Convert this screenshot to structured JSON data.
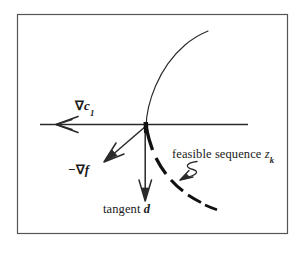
{
  "figure": {
    "type": "geometric-diagram",
    "background_color": "#ffffff",
    "frame": {
      "stroke": "#555555",
      "x": 17,
      "y": 14,
      "width": 271,
      "height": 220
    },
    "labels": {
      "gradient_c1": {
        "nabla": "∇",
        "base": "c",
        "subscript": "1",
        "plain": "∇c₁"
      },
      "negative_gradient_f": {
        "minus": "−",
        "nabla": "∇",
        "base": "f",
        "plain": "−∇f"
      },
      "tangent_d": {
        "text": "tangent ",
        "base": "d",
        "plain": "tangent d"
      },
      "feasible_sequence": {
        "text": "feasible sequence ",
        "base": "z",
        "subscript": "k",
        "plain": "feasible sequence zₖ"
      }
    },
    "elements": {
      "constraint_curve": {
        "name": "constraint-boundary-curve",
        "style": "thin-solid",
        "stroke": "#2a2a2a",
        "stroke_width": 1.1,
        "path": "M 146 127 C 147 95 168 56 208 32"
      },
      "feasible_curve": {
        "name": "feasible-sequence-dashed-curve",
        "style": "dashed-tapered",
        "stroke": "#111111",
        "stroke_width": 3.2,
        "path": "M 147 128 C 152 158 172 190 210 212"
      },
      "horizontal_axis_arrow": {
        "name": "gradient-c1-arrow",
        "from_x": 248,
        "from_y": 124,
        "to_x": 35,
        "to_y": 124,
        "stroke": "#2a2a2a"
      },
      "neg_gradient_arrow": {
        "name": "negative-gradient-f-arrow",
        "from_x": 146,
        "from_y": 126,
        "to_x": 105,
        "to_y": 162,
        "stroke": "#2a2a2a"
      },
      "tangent_arrow": {
        "name": "tangent-d-arrow",
        "from_x": 145,
        "from_y": 126,
        "to_x": 145,
        "to_y": 201,
        "stroke": "#2a2a2a"
      },
      "leader_squiggle": {
        "name": "feasible-sequence-leader-arrow",
        "stroke": "#2a2a2a",
        "path": "M 196 163 C 183 166 197 173 186 177"
      }
    }
  }
}
